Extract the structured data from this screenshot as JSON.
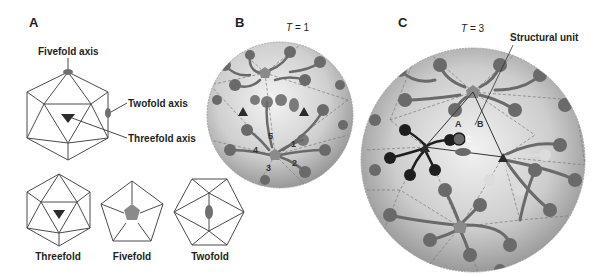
{
  "panels": {
    "A": {
      "letter": "A",
      "labels": {
        "fivefold_axis": "Fivefold axis",
        "twofold_axis": "Twofold axis",
        "threefold_axis": "Threefold axis"
      },
      "views": [
        {
          "label": "Threefold"
        },
        {
          "label": "Fivefold"
        },
        {
          "label": "Twofold"
        }
      ]
    },
    "B": {
      "letter": "B",
      "t_label": "T",
      "t_value": "= 1",
      "subunit_numbers": [
        "1",
        "2",
        "3",
        "4",
        "5"
      ]
    },
    "C": {
      "letter": "C",
      "t_label": "T",
      "t_value": "= 3",
      "structural_unit_label": "Structural unit",
      "subunit_letters": [
        "A",
        "B",
        "C"
      ]
    }
  },
  "colors": {
    "line": "#4a4a4a",
    "symbol_dark": "#2b2b2b",
    "symbol_mid": "#6f6f6f",
    "sphere_light": "#e6e6e6",
    "sphere_dark": "#8c8c8c",
    "subunit_dark": "#1e1e1e",
    "subunit_mid": "#6a6a6a",
    "subunit_light": "#9a9a9a"
  }
}
